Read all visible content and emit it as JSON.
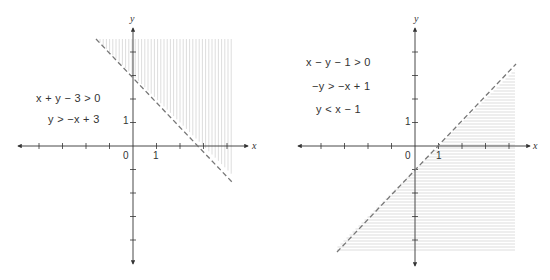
{
  "figures": [
    {
      "id": "left",
      "inequalities": [
        "x + y − 3 > 0",
        "y > −x + 3"
      ],
      "boundary_line": "y = -x + 3",
      "boundary_style": "dashed",
      "shaded_region": "above line (y > -x + 3)",
      "shading": "vertical hatch lines",
      "axis_labels": {
        "x": "x",
        "y": "y"
      },
      "tick_labels": {
        "origin": "0",
        "x_one": "1",
        "y_one": "1"
      }
    },
    {
      "id": "right",
      "inequalities": [
        "x − y − 1 > 0",
        "−y > −x + 1",
        "y < x − 1"
      ],
      "boundary_line": "y = x - 1",
      "boundary_style": "dashed",
      "shaded_region": "below line (y < x - 1)",
      "shading": "horizontal hatch lines",
      "axis_labels": {
        "x": "x",
        "y": "y"
      },
      "tick_labels": {
        "origin": "0",
        "x_one": "1",
        "y_one": "1"
      }
    }
  ],
  "chart_data": [
    {
      "type": "line",
      "title": "",
      "xlabel": "x",
      "ylabel": "y",
      "xlim": [
        -5,
        4.5
      ],
      "ylim": [
        -5,
        5
      ],
      "grid": false,
      "series": [
        {
          "name": "y = -x + 3 (dashed boundary)",
          "x": [
            -1.5,
            4.5
          ],
          "y": [
            4.5,
            -1.5
          ]
        }
      ],
      "shaded": "y > -x + 3",
      "annotations": [
        "x + y − 3 > 0",
        "y > −x + 3"
      ]
    },
    {
      "type": "line",
      "title": "",
      "xlabel": "x",
      "ylabel": "y",
      "xlim": [
        -5,
        4.5
      ],
      "ylim": [
        -5,
        5
      ],
      "grid": false,
      "series": [
        {
          "name": "y = x - 1 (dashed boundary)",
          "x": [
            -3.3,
            4.3
          ],
          "y": [
            -4.3,
            3.3
          ]
        }
      ],
      "shaded": "y < x - 1",
      "annotations": [
        "x − y − 1 > 0",
        "−y > −x + 1",
        "y < x − 1"
      ]
    }
  ]
}
